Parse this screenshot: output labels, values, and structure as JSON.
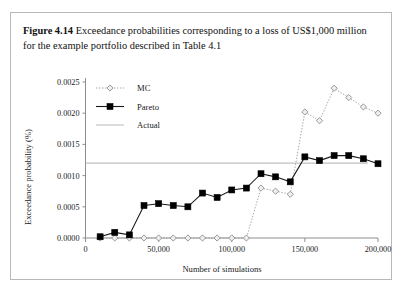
{
  "caption": {
    "label": "Figure 4.14",
    "text": "Exceedance probabilities corresponding to a loss of US$1,000 million for the example portfolio described in Table 4.1"
  },
  "chart_data": {
    "type": "line",
    "title": "",
    "xlabel": "Number of simulations",
    "ylabel": "Exceedance probability (%)",
    "xlim": [
      0,
      200000
    ],
    "ylim": [
      0,
      0.0025
    ],
    "xticks": [
      0,
      50000,
      100000,
      150000,
      200000
    ],
    "xticklabels": [
      "0",
      "50,000",
      "100,000",
      "150,000",
      "200,000"
    ],
    "yticks": [
      0.0,
      0.0005,
      0.001,
      0.0015,
      0.002,
      0.0025
    ],
    "yticklabels": [
      "0.0000",
      "0.0005",
      "0.0010",
      "0.0015",
      "0.0020",
      "0.0025"
    ],
    "grid": false,
    "legend_position": "top-left",
    "series": [
      {
        "name": "MC",
        "marker": "diamond",
        "linestyle": "dotted",
        "color": "#9a9a9a",
        "x": [
          10000,
          20000,
          30000,
          40000,
          50000,
          60000,
          70000,
          80000,
          90000,
          100000,
          110000,
          120000,
          130000,
          140000,
          150000,
          160000,
          170000,
          180000,
          190000,
          200000
        ],
        "values": [
          0.0,
          0.0,
          0.0,
          0.0,
          0.0,
          0.0,
          0.0,
          0.0,
          0.0,
          0.0,
          0.0,
          0.0008,
          0.00075,
          0.0007,
          0.00202,
          0.00188,
          0.0024,
          0.00225,
          0.0021,
          0.002
        ]
      },
      {
        "name": "Pareto",
        "marker": "square",
        "linestyle": "solid",
        "color": "#000000",
        "x": [
          10000,
          20000,
          30000,
          40000,
          50000,
          60000,
          70000,
          80000,
          90000,
          100000,
          110000,
          120000,
          130000,
          140000,
          150000,
          160000,
          170000,
          180000,
          190000,
          200000
        ],
        "values": [
          2e-05,
          9e-05,
          5e-05,
          0.00052,
          0.00055,
          0.00052,
          0.0005,
          0.00072,
          0.00065,
          0.00077,
          0.0008,
          0.00103,
          0.00098,
          0.0009,
          0.0013,
          0.00124,
          0.00132,
          0.00132,
          0.00127,
          0.00119
        ]
      },
      {
        "name": "Actual",
        "marker": "none",
        "linestyle": "solid",
        "color": "#c0c0c0",
        "constant_value": 0.0012
      }
    ]
  },
  "legend": {
    "items": [
      {
        "label": "MC"
      },
      {
        "label": "Pareto"
      },
      {
        "label": "Actual"
      }
    ]
  }
}
